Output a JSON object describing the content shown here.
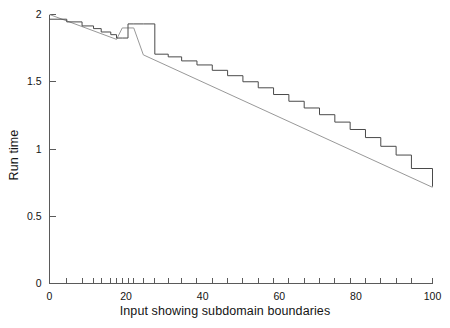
{
  "chart_data": {
    "type": "line",
    "title": "",
    "subtitle": "",
    "xlabel": "Input showing subdomain boundaries",
    "ylabel": "Run time",
    "xlim": [
      0,
      100
    ],
    "ylim": [
      0,
      2
    ],
    "grid": false,
    "legend": null,
    "legend_position": "none",
    "x_tick_labels": [
      "0",
      "20",
      "40",
      "60",
      "80",
      "100"
    ],
    "x_tick_label_values": [
      0,
      20,
      40,
      60,
      80,
      100
    ],
    "y_tick_labels": [
      "0",
      "0.5",
      "1",
      "1.5",
      "2"
    ],
    "y_tick_label_values": [
      0,
      0.5,
      1,
      1.5,
      2
    ],
    "x_minor_ticks": [
      0,
      4.5,
      8.5,
      11.5,
      13.5,
      16,
      17.5,
      19,
      20.5,
      22,
      24.5,
      27.5,
      31,
      34.5,
      38.5,
      42.5,
      46.5,
      50.5,
      54.5,
      58.5,
      62.5,
      66.5,
      70.5,
      74.5,
      78.5,
      82.5,
      86.5,
      90.5,
      94.5,
      100
    ],
    "x_minor_ticks_note": "tick marks mark subdomain boundaries; spacing is irregular and densest between 13 and 25",
    "series": [
      {
        "name": "step function (measured run time per subdomain)",
        "style": "step",
        "color": "#4a4a4a",
        "linewidth": 1.0,
        "x": [
          0,
          4.5,
          8.5,
          11.5,
          13.5,
          16,
          17.5,
          19,
          20.5,
          22,
          24.5,
          27.5,
          31,
          34.5,
          38.5,
          42.5,
          46.5,
          50.5,
          54.5,
          58.5,
          62.5,
          66.5,
          70.5,
          74.5,
          78.5,
          82.5,
          86.5,
          90.5,
          94.5,
          100
        ],
        "values": [
          1.965,
          1.945,
          1.915,
          1.895,
          1.87,
          1.85,
          1.825,
          1.825,
          1.93,
          1.93,
          1.93,
          1.705,
          1.685,
          1.655,
          1.625,
          1.585,
          1.545,
          1.5,
          1.455,
          1.405,
          1.355,
          1.305,
          1.255,
          1.2,
          1.145,
          1.085,
          1.02,
          0.955,
          0.855,
          0.72
        ]
      },
      {
        "name": "smooth trend line",
        "style": "line",
        "color": "#8c8c8c",
        "linewidth": 0.9,
        "x": [
          0,
          17.5,
          19,
          22,
          24.5,
          100
        ],
        "values": [
          2.0,
          1.815,
          1.9,
          1.9,
          1.7,
          0.715
        ]
      }
    ]
  },
  "figure": {
    "background_color": "#ffffff",
    "axis_color": "#5a5a5a",
    "text_color": "#141414"
  }
}
